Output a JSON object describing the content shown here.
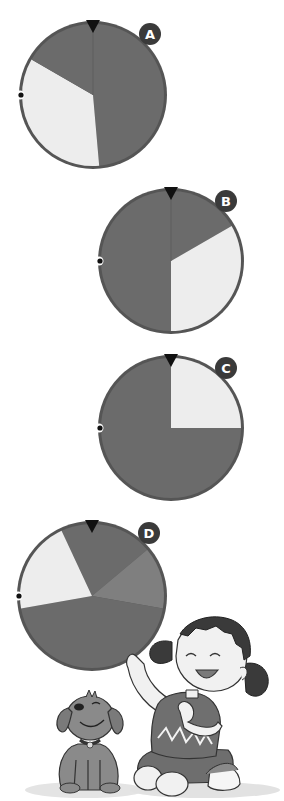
{
  "colors": {
    "rim": "#555555",
    "dark": "#6b6b6b",
    "medium": "#7f7f7f",
    "light": "#ededed",
    "pointer": "#111111",
    "badge": "#3a3a3a",
    "badge_text": "#ffffff",
    "dot_outer": "#ffffff",
    "dot_inner": "#111111"
  },
  "spinners": [
    {
      "label": "A",
      "cx": 93,
      "cy": 95,
      "r": 72,
      "badge": {
        "x": 150,
        "y": 34
      },
      "sectors": [
        {
          "start": 0,
          "end": 175,
          "color": "dark"
        },
        {
          "start": 175,
          "end": 300,
          "color": "light"
        },
        {
          "start": 300,
          "end": 360,
          "color": "dark"
        }
      ],
      "divider_top": true
    },
    {
      "label": "B",
      "cx": 171,
      "cy": 261,
      "r": 71,
      "badge": {
        "x": 226,
        "y": 201
      },
      "sectors": [
        {
          "start": 0,
          "end": 60,
          "color": "dark"
        },
        {
          "start": 60,
          "end": 180,
          "color": "light"
        },
        {
          "start": 180,
          "end": 360,
          "color": "dark"
        }
      ],
      "divider_top": true
    },
    {
      "label": "C",
      "cx": 171,
      "cy": 428,
      "r": 71,
      "badge": {
        "x": 226,
        "y": 368
      },
      "sectors": [
        {
          "start": 0,
          "end": 90,
          "color": "light"
        },
        {
          "start": 90,
          "end": 180,
          "color": "dark"
        },
        {
          "start": 180,
          "end": 360,
          "color": "dark"
        }
      ],
      "divider_top": false
    },
    {
      "label": "D",
      "cx": 92,
      "cy": 596,
      "r": 73,
      "badge": {
        "x": 149,
        "y": 533
      },
      "sectors": [
        {
          "start": 335,
          "end": 410,
          "color": "dark"
        },
        {
          "start": 50,
          "end": 100,
          "color": "medium"
        },
        {
          "start": 100,
          "end": 260,
          "color": "dark"
        },
        {
          "start": 260,
          "end": 335,
          "color": "light"
        }
      ],
      "divider_top": false
    }
  ]
}
